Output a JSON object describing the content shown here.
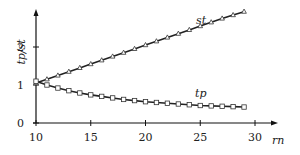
{
  "chart_data": {
    "type": "line",
    "title": "",
    "xlabel": "rn",
    "ylabel": "tp/st",
    "xlim": [
      10,
      30
    ],
    "ylim": [
      0,
      3
    ],
    "xticks": [
      10,
      15,
      20,
      25,
      30
    ],
    "yticks": [
      0,
      1,
      2
    ],
    "grid": false,
    "legend": "inline labels",
    "x": [
      10,
      11,
      12,
      13,
      14,
      15,
      16,
      17,
      18,
      19,
      20,
      21,
      22,
      23,
      24,
      25,
      26,
      27,
      28,
      29
    ],
    "series": [
      {
        "name": "st",
        "marker": "triangle",
        "values": [
          1.05,
          1.15,
          1.25,
          1.35,
          1.45,
          1.55,
          1.65,
          1.75,
          1.85,
          1.95,
          2.05,
          2.15,
          2.25,
          2.35,
          2.45,
          2.55,
          2.65,
          2.75,
          2.84,
          2.93
        ]
      },
      {
        "name": "tp",
        "marker": "square",
        "values": [
          1.1,
          1.0,
          0.92,
          0.85,
          0.79,
          0.74,
          0.7,
          0.66,
          0.62,
          0.59,
          0.56,
          0.54,
          0.52,
          0.5,
          0.48,
          0.46,
          0.45,
          0.44,
          0.43,
          0.42
        ]
      }
    ]
  },
  "labels": {
    "ylabel": "tp/st",
    "xlabel": "rn",
    "st": "st",
    "tp": "tp"
  }
}
